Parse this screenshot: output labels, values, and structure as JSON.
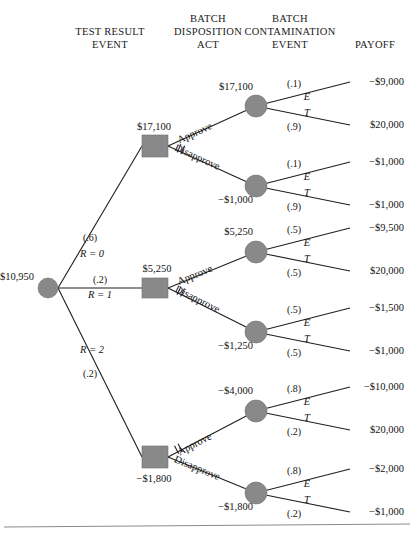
{
  "headers": [
    {
      "line1": "TEST RESULT",
      "line2": "EVENT",
      "x": 110
    },
    {
      "line1": "BATCH",
      "line2": "DISPOSITION",
      "line3": "ACT",
      "x": 208
    },
    {
      "line1": "BATCH",
      "line2": "CONTAMINATION",
      "line3": "EVENT",
      "x": 290
    },
    {
      "line1": "PAYOFF",
      "x": 375
    }
  ],
  "root": {
    "label": "$10,950",
    "x": 48,
    "y": 288,
    "r": 10
  },
  "test_branches": [
    {
      "prob": "(.6)",
      "result": "R = 0",
      "prob_x": 90,
      "prob_y": 241,
      "res_x": 92,
      "res_y": 257
    },
    {
      "prob": "(.2)",
      "result": "R = 1",
      "prob_x": 100,
      "prob_y": 283,
      "res_x": 100,
      "res_y": 298
    },
    {
      "prob": "(.2)",
      "result": "R = 2",
      "prob_x": 90,
      "prob_y": 377,
      "res_x": 92,
      "res_y": 353
    }
  ],
  "decisions": [
    {
      "label": "$17,100",
      "x": 155,
      "y": 146,
      "w": 26,
      "h": 22,
      "label_x": 154,
      "label_y": 130,
      "approve": "Approve",
      "disapprove": "Disapprove",
      "approve_x": 196,
      "approve_y": 136,
      "disapprove_x": 196,
      "disapprove_y": 160,
      "pruned": "disapprove"
    },
    {
      "label": "$5,250",
      "x": 155,
      "y": 288,
      "w": 26,
      "h": 20,
      "label_x": 157,
      "label_y": 272,
      "approve": "Approve",
      "disapprove": "Disapprove",
      "approve_x": 196,
      "approve_y": 278,
      "disapprove_x": 196,
      "disapprove_y": 302,
      "pruned": "disapprove"
    },
    {
      "label": "−$1,800",
      "x": 155,
      "y": 457,
      "w": 26,
      "h": 22,
      "label_x": 154,
      "label_y": 482,
      "approve": "Approve",
      "disapprove": "Disapprove",
      "approve_x": 196,
      "approve_y": 447,
      "disapprove_x": 196,
      "disapprove_y": 471,
      "pruned": "approve"
    }
  ],
  "chance_nodes": [
    {
      "label": "$17,100",
      "label_x": 253,
      "label_y": 90,
      "label_anchor": "end",
      "x": 256,
      "y": 106,
      "r": 11,
      "upper_prob": "(.1)",
      "lower_prob": "(.9)",
      "upper_prob_x": 294,
      "upper_prob_y": 87,
      "lower_prob_x": 294,
      "lower_prob_y": 130,
      "e_x": 307,
      "e_y": 100,
      "t_x": 307,
      "t_y": 116,
      "upper_payoff": "−$9,000",
      "lower_payoff": "$20,000",
      "upper_payoff_y": 85,
      "lower_payoff_y": 128
    },
    {
      "label": "−$1,000",
      "label_x": 253,
      "label_y": 203,
      "label_anchor": "end",
      "x": 256,
      "y": 186,
      "r": 11,
      "upper_prob": "(.1)",
      "lower_prob": "(.9)",
      "upper_prob_x": 294,
      "upper_prob_y": 167,
      "lower_prob_x": 294,
      "lower_prob_y": 210,
      "e_x": 307,
      "e_y": 180,
      "t_x": 307,
      "t_y": 196,
      "upper_payoff": "−$1,000",
      "lower_payoff": "−$1,000",
      "upper_payoff_y": 165,
      "lower_payoff_y": 208
    },
    {
      "label": "$5,250",
      "label_x": 253,
      "label_y": 235,
      "label_anchor": "end",
      "x": 256,
      "y": 252,
      "r": 11,
      "upper_prob": "(.5)",
      "lower_prob": "(.5)",
      "upper_prob_x": 294,
      "upper_prob_y": 233,
      "lower_prob_x": 294,
      "lower_prob_y": 276,
      "e_x": 307,
      "e_y": 246,
      "t_x": 307,
      "t_y": 262,
      "upper_payoff": "−$9,500",
      "lower_payoff": "$20,000",
      "upper_payoff_y": 231,
      "lower_payoff_y": 274
    },
    {
      "label": "−$1,250",
      "label_x": 253,
      "label_y": 349,
      "label_anchor": "end",
      "x": 256,
      "y": 332,
      "r": 11,
      "upper_prob": "(.5)",
      "lower_prob": "(.5)",
      "upper_prob_x": 294,
      "upper_prob_y": 313,
      "lower_prob_x": 294,
      "lower_prob_y": 356,
      "e_x": 307,
      "e_y": 326,
      "t_x": 307,
      "t_y": 342,
      "upper_payoff": "−$1,500",
      "lower_payoff": "−$1,000",
      "upper_payoff_y": 311,
      "lower_payoff_y": 354
    },
    {
      "label": "−$4,000",
      "label_x": 253,
      "label_y": 394,
      "label_anchor": "end",
      "x": 256,
      "y": 411,
      "r": 11,
      "upper_prob": "(.8)",
      "lower_prob": "(.2)",
      "upper_prob_x": 294,
      "upper_prob_y": 392,
      "lower_prob_x": 294,
      "lower_prob_y": 435,
      "e_x": 307,
      "e_y": 405,
      "t_x": 307,
      "t_y": 421,
      "upper_payoff": "−$10,000",
      "lower_payoff": "$20,000",
      "upper_payoff_y": 390,
      "lower_payoff_y": 433
    },
    {
      "label": "−$1,800",
      "label_x": 253,
      "label_y": 510,
      "label_anchor": "end",
      "x": 256,
      "y": 493,
      "r": 11,
      "upper_prob": "(.8)",
      "lower_prob": "(.2)",
      "upper_prob_x": 294,
      "upper_prob_y": 474,
      "lower_prob_x": 294,
      "lower_prob_y": 517,
      "e_x": 307,
      "e_y": 487,
      "t_x": 307,
      "t_y": 503,
      "upper_payoff": "−$2,000",
      "lower_payoff": "−$1,000",
      "upper_payoff_y": 472,
      "lower_payoff_y": 515
    }
  ],
  "payoff_x": 404,
  "baseline_y": 526
}
